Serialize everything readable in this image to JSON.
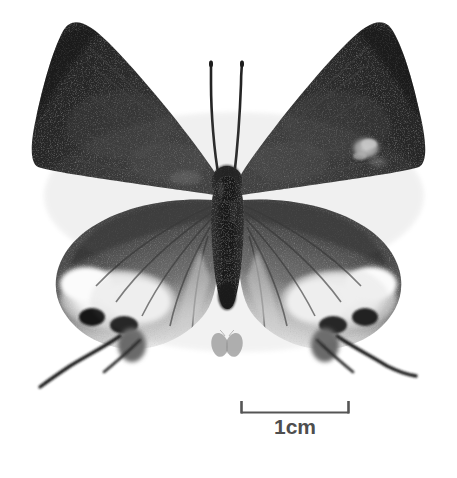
{
  "figure": {
    "kind": "specimen-photograph",
    "view": "dorsal",
    "rendering": "grayscale",
    "background_color": "#ffffff",
    "width_px": 457,
    "height_px": 478
  },
  "scale_bar": {
    "label": "1cm",
    "label_color": "#4e4e4e",
    "bar_color": "#555555",
    "left_px": 241,
    "right_px": 349,
    "bar_y_px": 413,
    "tick_top_px": 401,
    "length_px": 108
  },
  "watermark": {
    "name": "butterfly-watermark",
    "color": "#9b9b9b",
    "center_x_px": 227,
    "center_y_px": 347,
    "width_px": 26,
    "height_px": 22
  },
  "specimen": {
    "body": {
      "head_center": [
        227,
        180
      ],
      "thorax_top": [
        227,
        168
      ],
      "abdomen_tip": [
        227,
        312
      ],
      "color_dark": "#1a1a1a",
      "color_mid": "#2f2f2f"
    },
    "antennae": {
      "count": 2,
      "color": "#232323",
      "left_tip": [
        211,
        62
      ],
      "right_tip": [
        242,
        62
      ]
    },
    "forewings": {
      "count": 2,
      "color_base": "#242424",
      "color_shade": "#3a3a3a",
      "left_apex": [
        63,
        30
      ],
      "right_apex": [
        393,
        31
      ],
      "left_outer": [
        36,
        170
      ],
      "right_outer": [
        420,
        170
      ],
      "marking": {
        "name": "pale-discal-spot",
        "side": "right",
        "center": [
          366,
          148
        ],
        "color": "#c9c9c9"
      }
    },
    "hindwings": {
      "count": 2,
      "color_base": "#4a4a4a",
      "color_band": "#f2f2f2",
      "eyespot_color": "#141414",
      "left_outer": [
        55,
        265
      ],
      "right_outer": [
        400,
        265
      ],
      "white_band_left": [
        95,
        290
      ],
      "white_band_right": [
        360,
        290
      ]
    },
    "tails": {
      "count": 2,
      "color": "#1e1e1e",
      "left_tip": [
        40,
        387
      ],
      "right_tip": [
        416,
        376
      ]
    }
  }
}
